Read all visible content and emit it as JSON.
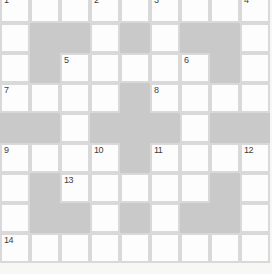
{
  "app": {
    "type": "crossword-puzzle-grid"
  },
  "colors": {
    "background": "#f7f7f5",
    "grid_line": "#d9d9d9",
    "cell_white": "#fdfdfd",
    "cell_blocked": "#c9c9c9",
    "number_text": "#3f3f3f"
  },
  "grid": {
    "rows": 9,
    "cols": 9,
    "cell_size": 30,
    "top_crop": -7,
    "cells": [
      ".........",
      ".##.#.##.",
      ".#.....#.",
      "....#....",
      "##.###.##",
      "....#....",
      ".#.....#.",
      ".##.#.##.",
      "........."
    ],
    "numbers": [
      {
        "num": "1",
        "row": 0,
        "col": 0
      },
      {
        "num": "2",
        "row": 0,
        "col": 3
      },
      {
        "num": "3",
        "row": 0,
        "col": 5
      },
      {
        "num": "4",
        "row": 0,
        "col": 8
      },
      {
        "num": "5",
        "row": 2,
        "col": 2
      },
      {
        "num": "6",
        "row": 2,
        "col": 6
      },
      {
        "num": "7",
        "row": 3,
        "col": 0
      },
      {
        "num": "8",
        "row": 3,
        "col": 5
      },
      {
        "num": "9",
        "row": 5,
        "col": 0
      },
      {
        "num": "10",
        "row": 5,
        "col": 3
      },
      {
        "num": "11",
        "row": 5,
        "col": 5
      },
      {
        "num": "12",
        "row": 5,
        "col": 8
      },
      {
        "num": "13",
        "row": 6,
        "col": 2
      },
      {
        "num": "14",
        "row": 8,
        "col": 0
      }
    ]
  }
}
